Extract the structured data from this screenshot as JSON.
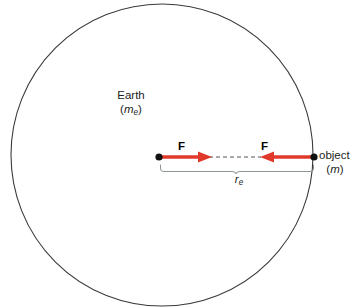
{
  "figure": {
    "caption_domain": "physics-diagram",
    "background_color": "#ffffff",
    "width": 352,
    "height": 307
  },
  "earth": {
    "name": "Earth",
    "mass_symbol": "m",
    "mass_subscript": "e",
    "mass_open_paren": "(",
    "mass_close_paren": ")",
    "circle": {
      "center_x": 162,
      "center_y": 155,
      "radius": 151,
      "stroke_color": "#3a3a3a",
      "stroke_width": 1.1,
      "fill": "none"
    },
    "center_dot": {
      "x": 159,
      "y": 157,
      "radius": 3.6,
      "color": "#111111"
    }
  },
  "object": {
    "name": "object",
    "mass_symbol": "m",
    "mass_open_paren": "(",
    "mass_close_paren": ")",
    "dot": {
      "x": 314,
      "y": 157,
      "radius": 3.6,
      "color": "#111111"
    }
  },
  "forces": {
    "color": "#e0392b",
    "label_left": "F",
    "label_right": "F",
    "left_arrow": {
      "x_start": 160,
      "x_end": 211,
      "y": 157,
      "direction": "right"
    },
    "right_arrow": {
      "x_start": 313,
      "x_end": 259,
      "y": 157,
      "direction": "left"
    },
    "dashed_connector": {
      "x_start": 211,
      "x_end": 259,
      "y": 157,
      "color": "#555555",
      "dash": "4 3"
    }
  },
  "radius_measure": {
    "symbol": "r",
    "subscript": "e",
    "brace": {
      "x_start": 160,
      "x_end": 314,
      "y_top": 164,
      "y_bottom": 171,
      "color": "#8e9599"
    }
  }
}
